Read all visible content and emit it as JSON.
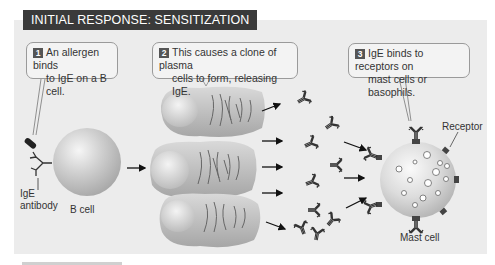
{
  "header": {
    "title": "INITIAL RESPONSE: SENSITIZATION"
  },
  "steps": [
    {
      "number": "1",
      "line1": "An allergen binds",
      "line2": "to IgE on a B cell."
    },
    {
      "number": "2",
      "line1": "This causes a clone of plasma",
      "line2": "cells to form, releasing IgE."
    },
    {
      "number": "3",
      "line1": "IgE binds to receptors on",
      "line2": "mast cells or basophils."
    }
  ],
  "labels": {
    "ige_antibody_1": "IgE",
    "ige_antibody_2": "antibody",
    "b_cell": "B cell",
    "receptor": "Receptor",
    "mast_cell": "Mast cell"
  },
  "colors": {
    "panel": "#ececec",
    "header_bg": "#3a3a3a",
    "cell_fill": "#c8c8c8",
    "antibody": "#3a3a3a"
  }
}
